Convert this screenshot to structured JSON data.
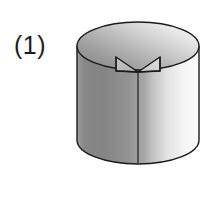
{
  "figure": {
    "label": "(1)",
    "caption_number": "1",
    "background_color": "#ffffff",
    "outline_color": "#1a1a1a",
    "outline_width": 1.4,
    "shape_name": "notched-cylinder",
    "canvas": {
      "width": 220,
      "height": 220
    }
  },
  "geometry": {
    "cylinder": {
      "center_x": 138,
      "top_ellipse_center_y": 46,
      "bottom_ellipse_center_y": 140,
      "radius_x": 61,
      "radius_y": 24,
      "left_x": 77,
      "right_x": 199,
      "top_y": 22,
      "bottom_y": 164,
      "body_height": 94,
      "seam_line_x": 138,
      "seam_top_y": 70,
      "seam_bottom_y": 163
    },
    "notch": {
      "apex_x": 138,
      "apex_y": 72,
      "left_corner_x": 116,
      "left_corner_y": 57,
      "right_corner_x": 160,
      "right_corner_y": 57,
      "left_base_y": 71,
      "right_base_y": 71,
      "opening_width": 44,
      "depth": 15
    }
  },
  "shading": {
    "top_face_light": "#f4f4f4",
    "top_face_mid": "#c9c9c9",
    "top_face_dark": "#8f8f8f",
    "body_left_dark": "#858585",
    "body_mid": "#a8a8a8",
    "body_right_light": "#fcfcfc",
    "notch_face_left": "#bdbdbd",
    "notch_face_right": "#d6d6d6"
  },
  "legend": {
    "top_face_name": "cylinder-top-face",
    "body_name": "cylinder-side-body",
    "notch_name": "wedge-notch"
  }
}
